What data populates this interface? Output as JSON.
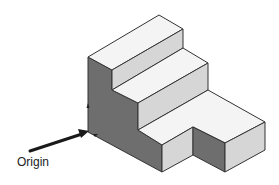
{
  "diagram": {
    "type": "isometric-stepped-block",
    "label": "Origin",
    "colors": {
      "top": "#f4f4f4",
      "front_light": "#d6d6d6",
      "side_dark": "#6e6e6e",
      "edge": "#333333",
      "arrow": "#1a1a1a"
    }
  }
}
